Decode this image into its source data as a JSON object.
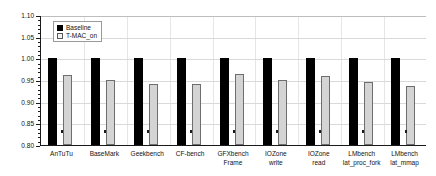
{
  "chart_data": {
    "type": "bar",
    "title": "",
    "xlabel": "",
    "ylabel": "",
    "ylim": [
      0.8,
      1.1
    ],
    "ytick_step": 0.05,
    "grid": true,
    "legend_position": "top-left",
    "categories": [
      "AnTuTu",
      "BaseMark",
      "Geekbench",
      "CF-bench",
      "GFXbench\nFrame",
      "IOZone\nwrite",
      "IOZone\nread",
      "LMbench\nlat_proc_fork",
      "LMbench\nlat_mmap"
    ],
    "ytick_labels": [
      "1.10",
      "1.05",
      "1.00",
      "0.95",
      "0.90",
      "0.85",
      "0.80"
    ],
    "ytick_values": [
      1.1,
      1.05,
      1.0,
      0.95,
      0.9,
      0.85,
      0.8
    ],
    "series": [
      {
        "name": "Baseline",
        "color": "#000000",
        "values": [
          1.0,
          1.0,
          1.0,
          1.0,
          1.0,
          1.0,
          1.0,
          1.0,
          1.0
        ]
      },
      {
        "name": "T-MAC_on",
        "color": "#d4d4d4",
        "values": [
          0.962,
          0.95,
          0.941,
          0.941,
          0.964,
          0.95,
          0.959,
          0.945,
          0.936
        ]
      }
    ]
  },
  "legend": {
    "items": [
      {
        "label": "Baseline",
        "swatch": "filled-black-square"
      },
      {
        "label": "T-MAC_on",
        "swatch": "open-gray-square"
      }
    ]
  },
  "colors": {
    "baseline_bar": "#000000",
    "tmac_bar": "#d4d4d4",
    "tmac_bar_edge": "#6e6e6e",
    "axis": "#1a1a1a",
    "grid": "#d9d9d9",
    "background": "#ffffff"
  }
}
